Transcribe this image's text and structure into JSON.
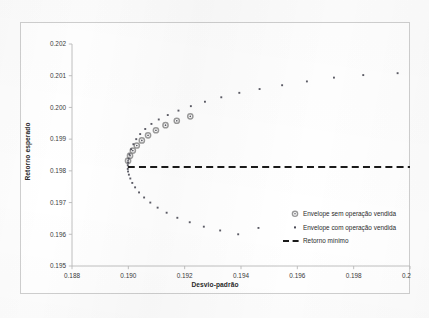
{
  "chart_data": {
    "type": "scatter",
    "title": "",
    "xlabel": "Desvio-padrão",
    "ylabel": "Retorno esperado",
    "xlim": [
      0.188,
      0.2
    ],
    "ylim": [
      0.195,
      0.202
    ],
    "xticks": [
      "0.188",
      "0.190",
      "0.192",
      "0.194",
      "0.196",
      "0.198",
      "0.200"
    ],
    "xtick_values": [
      0.188,
      0.19,
      0.192,
      0.194,
      0.196,
      0.198,
      0.2
    ],
    "yticks": [
      "0.195",
      "0.196",
      "0.197",
      "0.198",
      "0.199",
      "0.200",
      "0.201",
      "0.202"
    ],
    "ytick_values": [
      0.195,
      0.196,
      0.197,
      0.198,
      0.199,
      0.2,
      0.201,
      0.202
    ],
    "grid": false,
    "legend_position": "inside-lower-right",
    "series": [
      {
        "name": "Envelope sem operação vendida",
        "marker": "circle-open-gray",
        "marker_size": 5.2,
        "color": "#808080",
        "x": [
          0.18999,
          0.19006,
          0.19016,
          0.1903,
          0.19048,
          0.1907,
          0.19098,
          0.19132,
          0.19172,
          0.1922
        ],
        "y": [
          0.19832,
          0.19848,
          0.19864,
          0.1988,
          0.19896,
          0.19912,
          0.19928,
          0.19944,
          0.19958,
          0.19972
        ]
      },
      {
        "name": "Envelope com operação vendida",
        "marker": "dot-small",
        "marker_size": 1.9,
        "color": "#4a4a55",
        "x": [
          0.18998,
          0.18999,
          0.19001,
          0.19004,
          0.1901,
          0.19018,
          0.19028,
          0.19042,
          0.1906,
          0.19082,
          0.19108,
          0.1914,
          0.19178,
          0.19222,
          0.19272,
          0.1933,
          0.19394,
          0.19466,
          0.19546,
          0.19634,
          0.1973,
          0.19834,
          0.19956,
          0.18998,
          0.18999,
          0.19002,
          0.19007,
          0.19014,
          0.19024,
          0.19038,
          0.19056,
          0.19078,
          0.19104,
          0.19136,
          0.19174,
          0.19218,
          0.19268,
          0.19326,
          0.1939,
          0.19462
        ],
        "y": [
          0.19818,
          0.19826,
          0.19838,
          0.19852,
          0.19868,
          0.19884,
          0.199,
          0.19916,
          0.19932,
          0.19948,
          0.19962,
          0.19976,
          0.1999,
          0.20004,
          0.20018,
          0.20032,
          0.20046,
          0.20058,
          0.2007,
          0.20082,
          0.20094,
          0.20102,
          0.20108,
          0.19806,
          0.19798,
          0.19788,
          0.19776,
          0.19762,
          0.19748,
          0.19732,
          0.19716,
          0.197,
          0.19684,
          0.19668,
          0.19652,
          0.19638,
          0.19624,
          0.19612,
          0.196,
          0.1962
        ]
      },
      {
        "name": "Retorno mínimo",
        "marker": "dashed-line",
        "color": "#1a1a1a",
        "type": "hline",
        "y_value": 0.19812,
        "x_range": [
          0.18998,
          0.2
        ]
      }
    ]
  },
  "legend": {
    "items": [
      {
        "label": "Envelope sem operação vendida",
        "marker": "circle-open-gray"
      },
      {
        "label": "Envelope com operação vendida",
        "marker": "dot-small"
      },
      {
        "label": "Retorno mínimo",
        "marker": "dashed-line"
      }
    ]
  }
}
